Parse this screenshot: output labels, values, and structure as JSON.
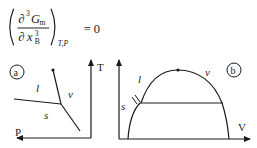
{
  "formula": {
    "numerator_symbol": "∂",
    "numerator_power": "3",
    "numerator_var": "G",
    "numerator_sub": "m",
    "denominator_symbol": "∂",
    "denominator_var": "x",
    "denominator_sub": "B",
    "denominator_power": "3",
    "held_constant": "T,P",
    "rhs": "= 0"
  },
  "panel_a": {
    "badge": "a",
    "x_axis_label": "P",
    "y_axis_label": "T",
    "regions": {
      "liquid": "l",
      "vapor": "v",
      "solid": "s"
    }
  },
  "panel_b": {
    "badge": "b",
    "x_axis_label": "V",
    "regions": {
      "liquid": "l",
      "vapor": "v",
      "solid": "s"
    }
  }
}
